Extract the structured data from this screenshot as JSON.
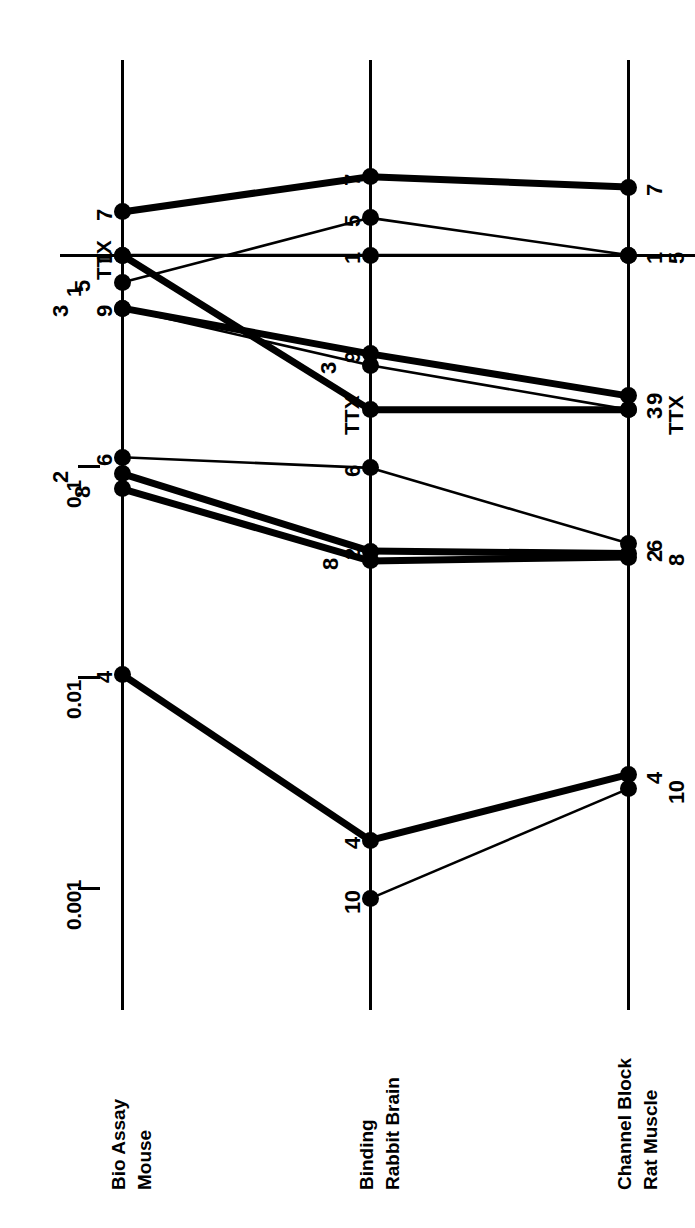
{
  "figure": {
    "orientation": "rotated-90-ccw",
    "scale_type": "log10",
    "y_axis": {
      "tick_labels": [
        "0.001",
        "0.01",
        "0.1",
        "1"
      ],
      "tick_values": [
        0.001,
        0.01,
        0.1,
        1
      ]
    },
    "columns": [
      {
        "id": "bioassay",
        "line1": "Bio Assay",
        "line2": "Mouse"
      },
      {
        "id": "binding",
        "line1": "Binding",
        "line2": "Rabbit Brain"
      },
      {
        "id": "channel",
        "line1": "Channel Block",
        "line2": "Rat Muscle"
      }
    ]
  },
  "chart_data": {
    "type": "line",
    "subtype": "parallel-coordinates-slopegraph",
    "title": "",
    "xlabel": "",
    "ylabel": "",
    "log_scale": true,
    "ylim": [
      0.0006,
      3.0
    ],
    "grid": false,
    "legend_position": "inline-point-labels",
    "categories": [
      "Bio Assay Mouse",
      "Binding Rabbit Brain",
      "Channel Block Rat Muscle"
    ],
    "axis_ticks": {
      "labels": [
        "0.001",
        "0.01",
        "0.1",
        "1"
      ],
      "values": [
        0.001,
        0.01,
        0.1,
        1
      ]
    },
    "reference_line": {
      "value": 1,
      "label": "1",
      "style": "solid-horizontal"
    },
    "series": [
      {
        "name": "7",
        "values": [
          1.6,
          2.35,
          2.1
        ],
        "weight": "thick",
        "labels": [
          "7",
          "7",
          "7"
        ]
      },
      {
        "name": "5",
        "values": [
          0.74,
          1.5,
          1.0
        ],
        "weight": "thin",
        "labels": [
          "5",
          "5",
          "5"
        ]
      },
      {
        "name": "1",
        "values": [
          1.0,
          1.0,
          1.0
        ],
        "weight": "thin",
        "labels": [
          "1",
          "1",
          "1"
        ]
      },
      {
        "name": "3",
        "values": [
          0.56,
          0.3,
          0.185
        ],
        "weight": "thin",
        "labels": [
          "3",
          "3",
          "3"
        ]
      },
      {
        "name": "9",
        "values": [
          0.56,
          0.34,
          0.215
        ],
        "weight": "thick",
        "labels": [
          "9",
          "9",
          "9"
        ]
      },
      {
        "name": "TTX",
        "values": [
          1.0,
          0.185,
          0.185
        ],
        "weight": "thick",
        "labels": [
          "TTX",
          "TTX",
          "TTX"
        ]
      },
      {
        "name": "6",
        "values": [
          0.11,
          0.098,
          0.043
        ],
        "weight": "thin",
        "labels": [
          "6",
          "6",
          "6"
        ]
      },
      {
        "name": "2",
        "values": [
          0.092,
          0.0395,
          0.0385
        ],
        "weight": "thick",
        "labels": [
          "2",
          "2",
          "2"
        ]
      },
      {
        "name": "8",
        "values": [
          0.078,
          0.0355,
          0.037
        ],
        "weight": "thick",
        "labels": [
          "8",
          "8",
          "8"
        ]
      },
      {
        "name": "4",
        "values": [
          0.0103,
          0.00168,
          0.00345
        ],
        "weight": "thick",
        "labels": [
          "4",
          "4",
          "4"
        ]
      },
      {
        "name": "10",
        "values": [
          null,
          0.00089,
          0.00295
        ],
        "weight": "thin",
        "labels": [
          "10",
          "10",
          "10"
        ]
      }
    ],
    "annotations": [
      "TTX appears as an explicit labeled series at all three columns",
      "Analog 10 has no Bio Assay Mouse value plotted",
      "Series 1 is flat at the value 1 across all three assays (reference compound)"
    ]
  }
}
